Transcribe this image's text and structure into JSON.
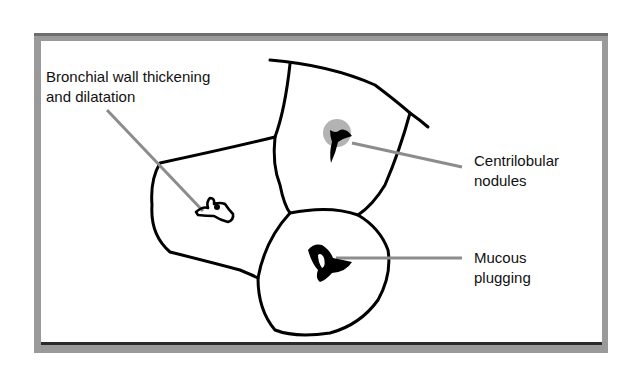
{
  "diagram": {
    "type": "schematic of secondary pulmonary lobules",
    "labels": {
      "bronchial": {
        "line1": "Bronchial wall thickening",
        "line2": "and dilatation"
      },
      "centrilobular": {
        "line1": "Centrilobular",
        "line2": "nodules"
      },
      "mucous": {
        "line1": "Mucous",
        "line2": "plugging"
      }
    },
    "colors": {
      "frame": "#9a9a9a",
      "outline": "#000000",
      "leader_line": "#8c8c8c",
      "nodule_halo": "#a0a0a0"
    }
  }
}
